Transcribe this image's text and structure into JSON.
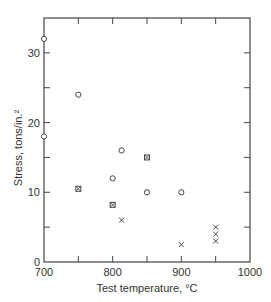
{
  "chart_data": {
    "type": "scatter",
    "title": "",
    "xlabel": "Test temperature, °C",
    "ylabel": "Stress, tons/in.²",
    "xlim": [
      700,
      1000
    ],
    "ylim": [
      0,
      35
    ],
    "xticks": [
      700,
      800,
      900,
      1000
    ],
    "yticks": [
      0,
      10,
      20,
      30
    ],
    "grid": false,
    "legend": null,
    "series": [
      {
        "name": "open circle",
        "marker": "circle",
        "points": [
          [
            700,
            32
          ],
          [
            700,
            18
          ],
          [
            750,
            24
          ],
          [
            800,
            12
          ],
          [
            813,
            16
          ],
          [
            850,
            10
          ],
          [
            900,
            10
          ]
        ]
      },
      {
        "name": "boxed cross",
        "marker": "square-x",
        "points": [
          [
            750,
            10.5
          ],
          [
            800,
            8.2
          ],
          [
            850,
            15
          ]
        ]
      },
      {
        "name": "cross",
        "marker": "x",
        "points": [
          [
            813,
            6
          ],
          [
            900,
            2.5
          ],
          [
            950,
            5
          ],
          [
            950,
            4
          ],
          [
            950,
            3
          ]
        ]
      }
    ]
  },
  "labels": {
    "x_axis": "Test temperature, °C",
    "y_axis": "Stress, tons/in.²",
    "x_ticks": [
      "700",
      "800",
      "900",
      "1000"
    ],
    "y_ticks": [
      "0",
      "10",
      "20",
      "30"
    ]
  }
}
